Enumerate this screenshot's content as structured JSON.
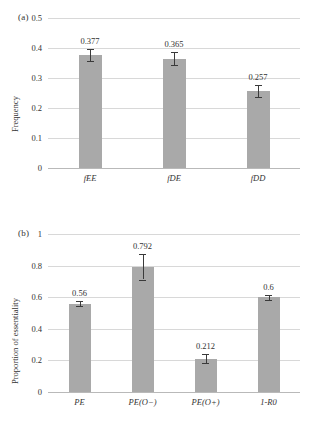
{
  "figure": {
    "panel_a_tag": "(a)",
    "panel_b_tag": "(b)"
  },
  "chart_data": [
    {
      "type": "bar",
      "panel": "(a)",
      "title": "",
      "xlabel": "",
      "ylabel": "Frequency",
      "categories": [
        "fEE",
        "fDE",
        "fDD"
      ],
      "values": [
        0.377,
        0.365,
        0.257
      ],
      "value_labels": [
        "0.377",
        "0.365",
        "0.257"
      ],
      "errors": [
        0.019,
        0.021,
        0.02
      ],
      "ylim": [
        0,
        0.5
      ],
      "yticks": [
        0,
        0.1,
        0.2,
        0.3,
        0.4,
        0.5
      ],
      "ytick_labels": [
        "0",
        "0.1",
        "0.2",
        "0.3",
        "0.4",
        "0.5"
      ],
      "grid": true,
      "legend": "none",
      "bar_color": "#a9a9a9",
      "error_color": "#3a3a3a"
    },
    {
      "type": "bar",
      "panel": "(b)",
      "title": "",
      "xlabel": "",
      "ylabel": "Proportion of essentiality",
      "categories": [
        "PE",
        "PE(O−)",
        "PE(O+)",
        "1-R0"
      ],
      "values": [
        0.56,
        0.792,
        0.212,
        0.6
      ],
      "value_labels": [
        "0.56",
        "0.792",
        "0.212",
        "0.6"
      ],
      "errors": [
        0.018,
        0.08,
        0.028,
        0.016
      ],
      "ylim": [
        0,
        1
      ],
      "yticks": [
        0,
        0.2,
        0.4,
        0.6,
        0.8,
        1
      ],
      "ytick_labels": [
        "0",
        "0.2",
        "0.4",
        "0.6",
        "0.8",
        "1"
      ],
      "grid": true,
      "legend": "none",
      "bar_color": "#a9a9a9",
      "error_color": "#3a3a3a"
    }
  ]
}
